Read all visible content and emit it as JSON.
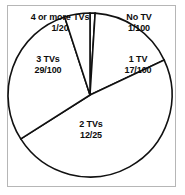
{
  "chart_data": {
    "type": "pie",
    "title": "",
    "subtitle": "",
    "xlabel": "",
    "ylabel": "",
    "legend_position": "none",
    "grid": false,
    "start_angle_deg": 0,
    "direction": "clockwise",
    "categories": [
      "No TV",
      "1 TV",
      "2 TVs",
      "3 TVs",
      "4 or more TVs"
    ],
    "value_labels": [
      "1/100",
      "17/100",
      "12/25",
      "29/100",
      "1/20"
    ],
    "values": [
      0.01,
      0.17,
      0.48,
      0.29,
      0.05
    ],
    "slices": [
      {
        "name": "No TV",
        "value_label": "1/100",
        "value": 0.01,
        "percent": 1,
        "angle_deg": 3.6,
        "start_deg": 0,
        "end_deg": 3.6,
        "fill": "#ffffff",
        "stroke": "#111111"
      },
      {
        "name": "1 TV",
        "value_label": "17/100",
        "value": 0.17,
        "percent": 17,
        "angle_deg": 61.2,
        "start_deg": 3.6,
        "end_deg": 64.8,
        "fill": "#ffffff",
        "stroke": "#111111"
      },
      {
        "name": "2 TVs",
        "value_label": "12/25",
        "value": 0.48,
        "percent": 48,
        "angle_deg": 172.8,
        "start_deg": 64.8,
        "end_deg": 237.6,
        "fill": "#ffffff",
        "stroke": "#111111"
      },
      {
        "name": "3 TVs",
        "value_label": "29/100",
        "value": 0.29,
        "percent": 29,
        "angle_deg": 104.4,
        "start_deg": 237.6,
        "end_deg": 342.0,
        "fill": "#ffffff",
        "stroke": "#111111"
      },
      {
        "name": "4 or more TVs",
        "value_label": "1/20",
        "value": 0.05,
        "percent": 5,
        "angle_deg": 18.0,
        "start_deg": 342.0,
        "end_deg": 360.0,
        "fill": "#ffffff",
        "stroke": "#111111"
      }
    ]
  },
  "frame": {
    "border_color": "#b6b6b6",
    "background": "#ffffff"
  }
}
